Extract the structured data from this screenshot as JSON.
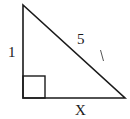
{
  "diagram": {
    "type": "right-triangle",
    "colors": {
      "stroke": "#1a1a1a",
      "background": "#ffffff"
    },
    "vertices": {
      "top": [
        23,
        5
      ],
      "right_angle": [
        23,
        98
      ],
      "bottom_right": [
        125,
        98
      ]
    },
    "right_angle_marker": {
      "x": 23,
      "y": 76,
      "size": 22
    },
    "labels": {
      "left_leg": "1",
      "hypotenuse": "5",
      "bottom_leg": "X"
    },
    "annotation_mark": "tick"
  }
}
